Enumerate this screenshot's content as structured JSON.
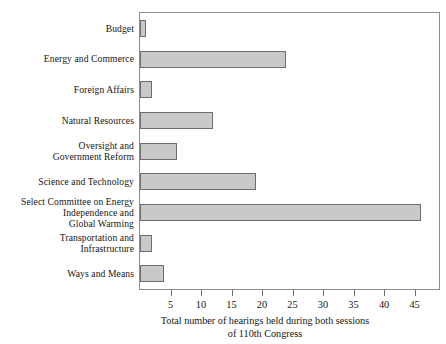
{
  "chart_data": {
    "type": "bar",
    "orientation": "horizontal",
    "title": "",
    "xlabel": "Total number of hearings held during both sessions of 110th Congress",
    "ylabel": "",
    "xlim": [
      0,
      49
    ],
    "grid": false,
    "legend": null,
    "xticks": [
      5,
      10,
      15,
      20,
      25,
      30,
      35,
      40,
      45
    ],
    "categories": [
      "Budget",
      "Energy and Commerce",
      "Foreign Affairs",
      "Natural Resources",
      "Oversight and Government Reform",
      "Science and Technology",
      "Select Committee on Energy Independence and Global Warming",
      "Transportation and Infrastructure",
      "Ways and Means"
    ],
    "values": [
      1,
      24,
      2,
      12,
      6,
      19,
      46,
      2,
      4
    ],
    "bar_fill_color": "#c9c9c9",
    "bar_border_color": "#6e6e6e",
    "frame_color": "#8d8d8d"
  },
  "labels": [
    {
      "lines": [
        "Budget"
      ]
    },
    {
      "lines": [
        "Energy and Commerce"
      ]
    },
    {
      "lines": [
        "Foreign Affairs"
      ]
    },
    {
      "lines": [
        "Natural Resources"
      ]
    },
    {
      "lines": [
        "Oversight and",
        "Government Reform"
      ]
    },
    {
      "lines": [
        "Science and Technology"
      ]
    },
    {
      "lines": [
        "Select Committee on Energy",
        "Independence and",
        "Global Warming"
      ]
    },
    {
      "lines": [
        "Transportation and",
        "Infrastructure"
      ]
    },
    {
      "lines": [
        "Ways and Means"
      ]
    }
  ],
  "caption": {
    "line1": "Total number of hearings held during both sessions",
    "line2": "of 110th Congress"
  },
  "axis": {
    "tick_labels": [
      "5",
      "10",
      "15",
      "20",
      "25",
      "30",
      "35",
      "40",
      "45"
    ]
  }
}
